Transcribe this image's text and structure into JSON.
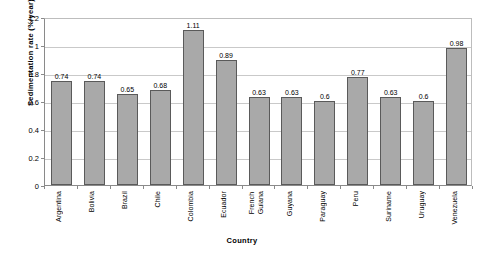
{
  "chart_data": {
    "type": "bar",
    "title": "",
    "xlabel": "Country",
    "ylabel": "Sedimentation rate (%/year)",
    "ylim": [
      0,
      1.2
    ],
    "ytick_labels": [
      "1.2",
      "1",
      "0.8",
      "0.6",
      "0.4",
      "0.2",
      "0"
    ],
    "ytick_values": [
      1.2,
      1.0,
      0.8,
      0.6,
      0.4,
      0.2,
      0
    ],
    "grid": true,
    "legend": false,
    "categories": [
      "Argentina",
      "Bolivia",
      "Brazil",
      "Chile",
      "Colombia",
      "Ecuador",
      "French Guiana",
      "Guyana",
      "Paraguay",
      "Peru",
      "Suriname",
      "Uruguay",
      "Venezuela"
    ],
    "values": [
      0.74,
      0.74,
      0.65,
      0.68,
      1.11,
      0.89,
      0.63,
      0.63,
      0.6,
      0.77,
      0.63,
      0.6,
      0.98
    ],
    "data_labels": [
      "0.74",
      "0.74",
      "0.65",
      "0.68",
      "1.11",
      "0.89",
      "0.63",
      "0.63",
      "0.6",
      "0.77",
      "0.63",
      "0.6",
      "0.98"
    ],
    "series_color": "#a9a9a9",
    "bar_border_color": "#5a5a5a",
    "grid_color": "#c9c9c9",
    "axis_color": "#8a8a8a"
  }
}
